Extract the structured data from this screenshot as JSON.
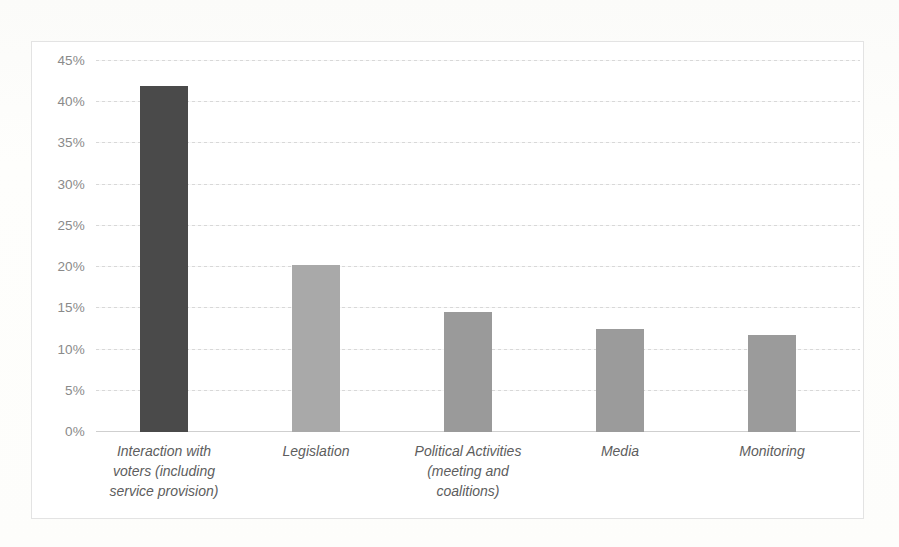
{
  "chart_data": {
    "type": "bar",
    "title": "",
    "subtitle": "",
    "xlabel": "",
    "ylabel": "",
    "categories": [
      "Interaction with\nvoters (including\nservice provision)",
      "Legislation",
      "Political Activities\n(meeting and\ncoalitions)",
      "Media",
      "Monitoring"
    ],
    "values": [
      42.0,
      20.3,
      14.6,
      12.5,
      11.8
    ],
    "value_labels": [
      "42.0%",
      "20.3%",
      "14.6%",
      "12.5%",
      "11.8%"
    ],
    "bar_colors": [
      "#4a4a4a",
      "#a9a9a9",
      "#9a9a9a",
      "#9b9b9b",
      "#9b9b9b"
    ],
    "ylim": [
      0,
      45
    ],
    "ytick_values": [
      45,
      40,
      35,
      30,
      25,
      20,
      15,
      10,
      5,
      0
    ],
    "ytick_labels": [
      "45%",
      "40%",
      "35%",
      "30%",
      "25%",
      "20%",
      "15%",
      "10%",
      "5%",
      "0%"
    ],
    "grid": true,
    "grid_color": "#d8d8d8",
    "legend": false,
    "legend_position": "none",
    "axis_color": "#cfcfcf",
    "plot_background": "#ffffff",
    "frame_border_color": "#e3e3e3",
    "tick_label_color": "#8a8a8a",
    "category_label_color": "#5d5d5d"
  }
}
